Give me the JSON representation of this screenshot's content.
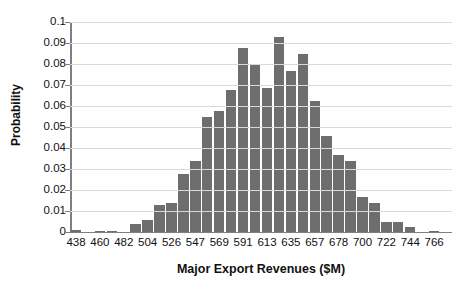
{
  "chart_data": {
    "type": "bar",
    "title": "",
    "xlabel": "Major Export Revenues ($M)",
    "ylabel": "Probability",
    "ylim": [
      0,
      0.1
    ],
    "grid": true,
    "legend": null,
    "y_ticks": [
      "0",
      "0.01",
      "0.02",
      "0.03",
      "0.04",
      "0.05",
      "0.06",
      "0.07",
      "0.08",
      "0.09",
      "0.1"
    ],
    "y_tick_values": [
      0,
      0.01,
      0.02,
      0.03,
      0.04,
      0.05,
      0.06,
      0.07,
      0.08,
      0.09,
      0.1
    ],
    "x_tick_labels": [
      "438",
      "460",
      "482",
      "504",
      "526",
      "547",
      "569",
      "591",
      "613",
      "635",
      "657",
      "678",
      "700",
      "722",
      "744",
      "766"
    ],
    "categories": [
      "438",
      "449",
      "460",
      "471",
      "482",
      "493",
      "504",
      "515",
      "526",
      "537",
      "547",
      "558",
      "569",
      "580",
      "591",
      "602",
      "613",
      "624",
      "635",
      "646",
      "657",
      "667",
      "678",
      "689",
      "700",
      "711",
      "722",
      "733",
      "744",
      "755",
      "766",
      "777"
    ],
    "values": [
      0.0008,
      0.0,
      0.0006,
      0.0007,
      0.0,
      0.0036,
      0.0056,
      0.0127,
      0.0137,
      0.0277,
      0.0339,
      0.0548,
      0.0578,
      0.0678,
      0.0878,
      0.0798,
      0.0687,
      0.0927,
      0.0768,
      0.0847,
      0.0626,
      0.0457,
      0.0367,
      0.0337,
      0.0167,
      0.0137,
      0.0046,
      0.0046,
      0.0023,
      0.0,
      0.0006,
      0.0
    ],
    "bar_color": "#6e6e6e",
    "grid_color": "#d9d9d9",
    "axis_color": "#7f7f7f"
  }
}
